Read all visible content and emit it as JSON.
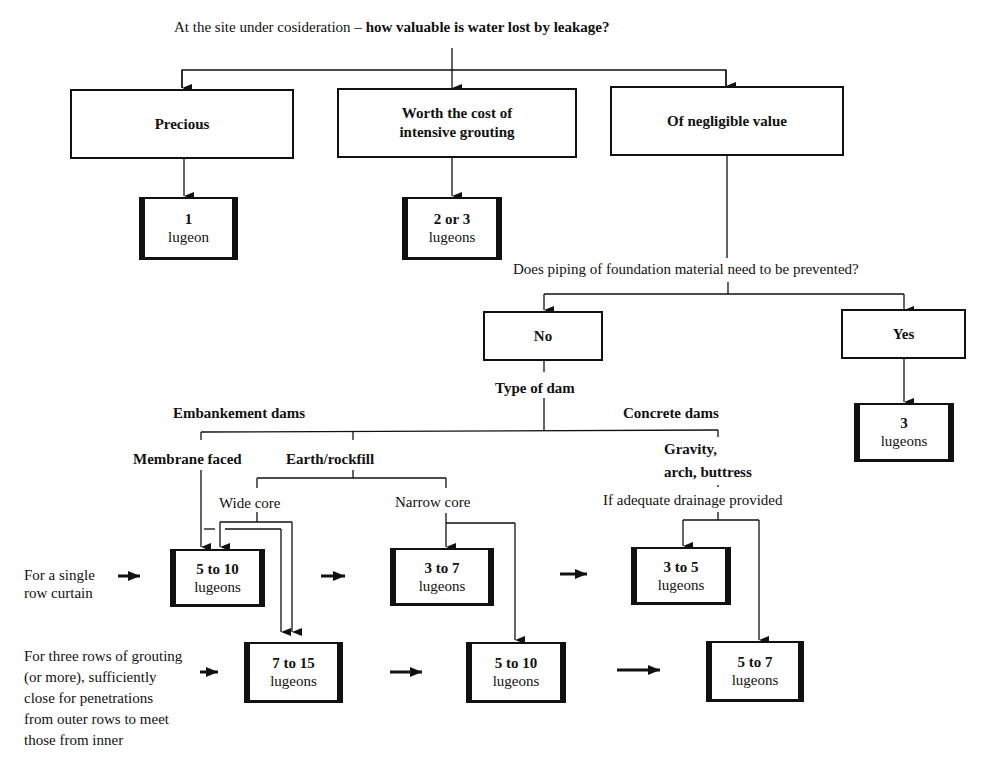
{
  "title": {
    "prefix": "At the site under cosideration – ",
    "question": "how valuable is water lost by leakage?"
  },
  "value_options": [
    {
      "label": "Precious"
    },
    {
      "label_line1": "Worth the cost of",
      "label_line2": "intensive grouting"
    },
    {
      "label": "Of negligible value"
    }
  ],
  "top_results": [
    {
      "value": "1",
      "unit": "lugeon"
    },
    {
      "value": "2 or 3",
      "unit": "lugeons"
    }
  ],
  "piping_question": "Does piping of foundation material need to be prevented?",
  "piping_options": {
    "no": "No",
    "yes": "Yes"
  },
  "yes_result": {
    "value": "3",
    "unit": "lugeons"
  },
  "type_of_dam": "Type of dam",
  "dam_types": {
    "embankment": "Embankement dams",
    "concrete": "Concrete dams",
    "membrane": "Membrane faced",
    "earth": "Earth/rockfill",
    "wide_core": "Wide core",
    "narrow_core": "Narrow core",
    "gravity_line1": "Gravity,",
    "gravity_line2": "arch, buttress",
    "drainage": "If adequate drainage provided"
  },
  "row_labels": {
    "single": [
      "For a single",
      "row curtain"
    ],
    "three": [
      "For three rows of grouting",
      "(or more), sufficiently",
      "close for penetrations",
      "from outer rows to meet",
      "those from inner"
    ]
  },
  "single_row_results": [
    {
      "value": "5 to 10",
      "unit": "lugeons"
    },
    {
      "value": "3 to 7",
      "unit": "lugeons"
    },
    {
      "value": "3 to 5",
      "unit": "lugeons"
    }
  ],
  "three_row_results": [
    {
      "value": "7 to 15",
      "unit": "lugeons"
    },
    {
      "value": "5 to 10",
      "unit": "lugeons"
    },
    {
      "value": "5 to 7",
      "unit": "lugeons"
    }
  ]
}
